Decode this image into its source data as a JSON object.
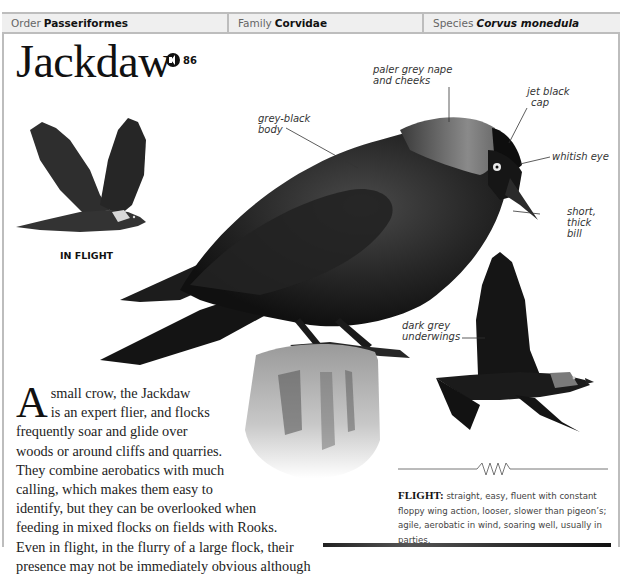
{
  "page_number": "",
  "taxonomy": {
    "order_label": "Order",
    "order_value": "Passeriformes",
    "family_label": "Family",
    "family_value": "Corvidae",
    "species_label": "Species",
    "species_value": "Corvus monedula"
  },
  "title": "Jackdaw",
  "audio": {
    "icon": "speaker-icon",
    "track_number": "86"
  },
  "in_flight_label": "IN FLIGHT",
  "callouts": {
    "nape": "paler grey nape and cheeks",
    "nape_lines": [
      "paler grey nape",
      "and cheeks"
    ],
    "cap_lines": [
      "jet black",
      "cap"
    ],
    "body_lines": [
      "grey-black",
      "body"
    ],
    "eye": "whitish eye",
    "bill_lines": [
      "short,",
      "thick",
      "bill"
    ],
    "underwings_lines": [
      "dark grey",
      "underwings"
    ]
  },
  "description": {
    "drop_cap": "A",
    "lines": [
      "small crow, the Jackdaw",
      "is an expert flier, and flocks",
      "frequently soar and glide over",
      "woods or around cliffs and quarries.",
      "They combine aerobatics with much",
      "calling, which makes them easy to",
      "identify, but they can be overlooked when",
      "feeding in mixed flocks on fields with Rooks.",
      "Even in flight, in the flurry of a large flock, their",
      "presence may not be immediately obvious although"
    ]
  },
  "flight": {
    "label": "FLIGHT:",
    "text": "straight, easy, fluent with constant floppy wing action, looser, slower than pigeon’s; agile, aerobatic in wind, soaring well, usually in parties."
  },
  "images": {
    "main": "perched-jackdaw-photo",
    "in_flight_illustration": "jackdaw-in-flight-illustration",
    "flight_photo": "jackdaw-flying-photo",
    "post": "wooden-post"
  }
}
